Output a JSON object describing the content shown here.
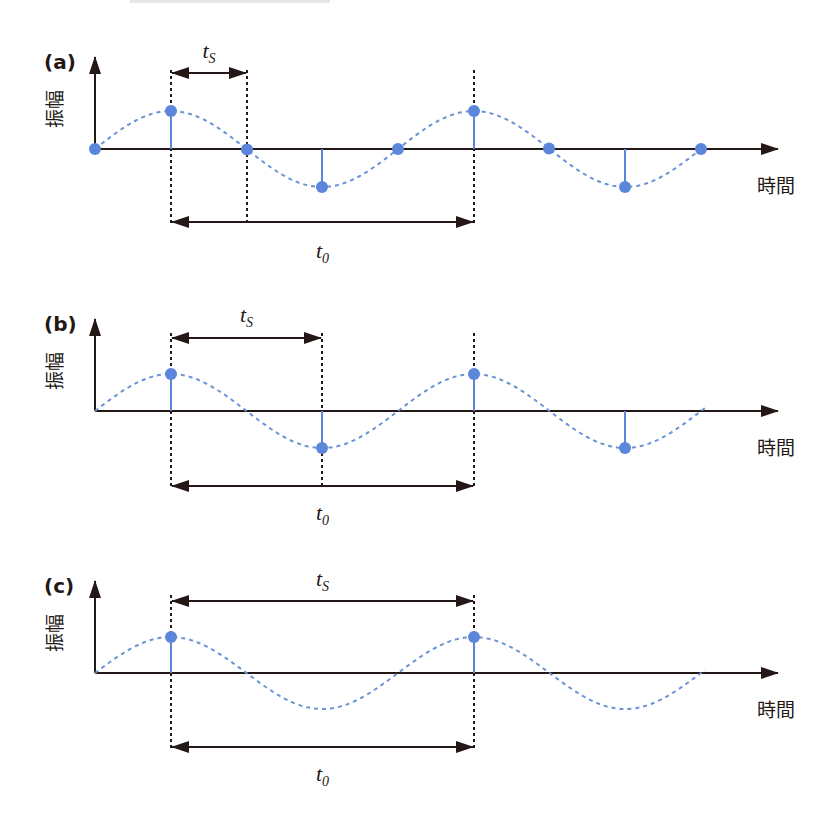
{
  "figure": {
    "width": 826,
    "height": 813,
    "colors": {
      "axis": "#231815",
      "wave": "#6a93d6",
      "sample": "#5b86d9",
      "guide": "#231815"
    },
    "labels": {
      "amplitude": "振幅",
      "time": "時間",
      "ts_main": "t",
      "ts_sub": "S",
      "t0_main": "t",
      "t0_sub": "0"
    },
    "panels": [
      {
        "id": "a",
        "tag": "(a)",
        "axis_y": 149,
        "amplitude": 38,
        "sample_xs": [
          95,
          171,
          247,
          322,
          398,
          474,
          549,
          625,
          701
        ],
        "ts": {
          "x1": 171,
          "x2": 247,
          "arrow_y": 73,
          "label_y": 58
        },
        "t0": {
          "x1": 171,
          "x2": 474,
          "arrow_y": 222,
          "label_y": 258
        },
        "guide_bottom": 225,
        "guide_top": 70
      },
      {
        "id": "b",
        "tag": "(b)",
        "axis_y": 411,
        "amplitude": 37,
        "sample_xs": [
          171,
          322,
          474,
          625
        ],
        "ts": {
          "x1": 171,
          "x2": 322,
          "arrow_y": 338,
          "label_y": 322
        },
        "t0": {
          "x1": 171,
          "x2": 474,
          "arrow_y": 486,
          "label_y": 520
        },
        "guide_bottom": 489,
        "guide_top": 333
      },
      {
        "id": "c",
        "tag": "(c)",
        "axis_y": 673,
        "amplitude": 36,
        "sample_xs": [
          171,
          474
        ],
        "ts": {
          "x1": 171,
          "x2": 474,
          "arrow_y": 601,
          "label_y": 586
        },
        "t0": {
          "x1": 171,
          "x2": 474,
          "arrow_y": 747,
          "label_y": 781
        },
        "guide_bottom": 750,
        "guide_top": 595
      }
    ],
    "wave": {
      "x_start": 95,
      "x_end": 705,
      "period": 303
    },
    "axes": {
      "x_left": 95,
      "x_arrow_end": 778,
      "y_arrow_top_offset": 94
    }
  }
}
